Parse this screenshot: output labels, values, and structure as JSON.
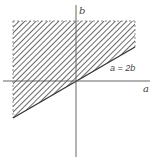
{
  "diagram": {
    "title": "",
    "axes": {
      "x_label": "a",
      "y_label": "b"
    },
    "boundary_line": {
      "label": "a = 2b",
      "equation": "a = 2b"
    },
    "region": {
      "description": "hatched region above line a = 2b",
      "style": "diagonal hatching",
      "edges_dashed": [
        "top",
        "left",
        "right"
      ]
    },
    "colors": {
      "axis": "#555555",
      "hatch": "#444444",
      "background": "#ffffff"
    }
  }
}
